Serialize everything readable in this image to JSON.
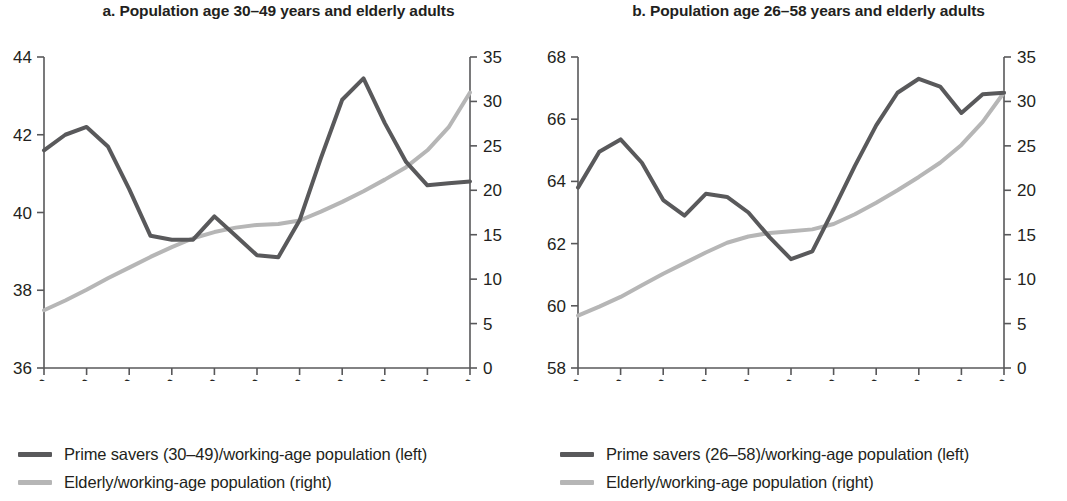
{
  "panels": [
    {
      "id": "a",
      "title": "a. Population age 30–49 years and elderly adults",
      "legend": [
        {
          "label": "Prime savers (30–49)/working-age population (left)",
          "color": "#59595b"
        },
        {
          "label": "Elderly/working-age population (right)",
          "color": "#b6b6b6"
        }
      ]
    },
    {
      "id": "b",
      "title": "b. Population age 26–58 years and elderly adults",
      "legend": [
        {
          "label": "Prime savers (26–58)/working-age population (left)",
          "color": "#59595b"
        },
        {
          "label": "Elderly/working-age population (right)",
          "color": "#b6b6b6"
        }
      ]
    }
  ],
  "chart_data": [
    {
      "type": "line",
      "title": "a. Population age 30–49 years and elderly adults",
      "xlabel": "",
      "ylabel": "",
      "grid": false,
      "legend_position": "below",
      "x": [
        1950,
        1955,
        1960,
        1965,
        1970,
        1975,
        1980,
        1985,
        1990,
        1995,
        2000,
        2005,
        2010,
        2015,
        2020,
        2025,
        2030,
        2035,
        2040,
        2045,
        2050
      ],
      "xtick_labels": [
        "1950",
        "1960",
        "1970",
        "1980",
        "1990",
        "2000",
        "2010",
        "2020",
        "2030",
        "2040",
        "2050"
      ],
      "axes": [
        {
          "side": "left",
          "ylim": [
            36,
            44
          ],
          "ticks": [
            36,
            38,
            40,
            42,
            44
          ]
        },
        {
          "side": "right",
          "ylim": [
            0,
            35
          ],
          "ticks": [
            0,
            5,
            10,
            15,
            20,
            25,
            30,
            35
          ]
        }
      ],
      "series": [
        {
          "name": "Prime savers (30–49)/working-age population (left)",
          "axis": "left",
          "color": "#59595b",
          "values": [
            41.6,
            42.0,
            42.2,
            41.7,
            40.6,
            39.4,
            39.3,
            39.3,
            39.9,
            39.4,
            38.9,
            38.85,
            39.8,
            41.4,
            42.9,
            43.45,
            42.3,
            41.3,
            40.7,
            40.75,
            40.8
          ]
        },
        {
          "name": "Elderly/working-age population (right)",
          "axis": "right",
          "color": "#b6b6b6",
          "values": [
            6.5,
            7.6,
            8.8,
            10.1,
            11.3,
            12.5,
            13.6,
            14.6,
            15.3,
            15.8,
            16.1,
            16.2,
            16.6,
            17.6,
            18.7,
            19.9,
            21.2,
            22.6,
            24.5,
            27.1,
            31.0
          ]
        }
      ]
    },
    {
      "type": "line",
      "title": "b. Population age 26–58 years and elderly adults",
      "xlabel": "",
      "ylabel": "",
      "grid": false,
      "legend_position": "below",
      "x": [
        1950,
        1955,
        1960,
        1965,
        1970,
        1975,
        1980,
        1985,
        1990,
        1995,
        2000,
        2005,
        2010,
        2015,
        2020,
        2025,
        2030,
        2035,
        2040,
        2045,
        2050
      ],
      "xtick_labels": [
        "1950",
        "1960",
        "1970",
        "1980",
        "1990",
        "2000",
        "2010",
        "2020",
        "2030",
        "2040",
        "2050"
      ],
      "axes": [
        {
          "side": "left",
          "ylim": [
            58,
            68
          ],
          "ticks": [
            58,
            60,
            62,
            64,
            66,
            68
          ]
        },
        {
          "side": "right",
          "ylim": [
            0,
            35
          ],
          "ticks": [
            0,
            5,
            10,
            15,
            20,
            25,
            30,
            35
          ]
        }
      ],
      "series": [
        {
          "name": "Prime savers (26–58)/working-age population (left)",
          "axis": "left",
          "color": "#59595b",
          "values": [
            63.8,
            64.95,
            65.35,
            64.6,
            63.4,
            62.9,
            63.6,
            63.5,
            63.0,
            62.2,
            61.5,
            61.75,
            63.1,
            64.5,
            65.8,
            66.85,
            67.3,
            67.05,
            66.2,
            66.8,
            66.85
          ]
        },
        {
          "name": "Elderly/working-age population (right)",
          "axis": "right",
          "color": "#b6b6b6",
          "values": [
            5.9,
            6.9,
            8.0,
            9.3,
            10.6,
            11.8,
            13.0,
            14.1,
            14.8,
            15.2,
            15.4,
            15.6,
            16.2,
            17.3,
            18.6,
            20.0,
            21.5,
            23.1,
            25.1,
            27.7,
            31.0
          ]
        }
      ]
    }
  ]
}
